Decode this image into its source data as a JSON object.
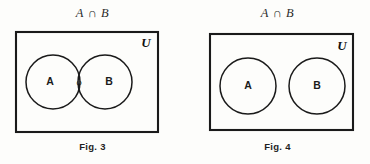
{
  "page": {
    "background_color": "#fdfdfb",
    "ink_color": "#1a1a1a"
  },
  "figures": [
    {
      "id": "fig-3",
      "title": "A ∩ B",
      "caption": "Fig. 3",
      "universe_label": "U",
      "sets": [
        {
          "label": "A"
        },
        {
          "label": "B"
        }
      ],
      "intersection": {
        "label": "φ",
        "state": "overlapping"
      }
    },
    {
      "id": "fig-4",
      "title": "A ∩ B",
      "caption": "Fig. 4",
      "universe_label": "U",
      "sets": [
        {
          "label": "A"
        },
        {
          "label": "B"
        }
      ],
      "intersection": {
        "label": "",
        "state": "disjoint"
      }
    }
  ]
}
